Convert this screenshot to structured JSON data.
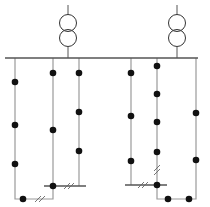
{
  "diagram": {
    "title": "",
    "colors": {
      "line": "#9a9a9a",
      "node": "#111111",
      "bus": "#555555"
    },
    "busbar": {
      "x1": 5,
      "x2": 198,
      "y": 58
    },
    "transformers": [
      {
        "id": "T1",
        "x": 68,
        "top": 5,
        "c1": 23,
        "c2": 38,
        "r": 8.5,
        "bottom": 58
      },
      {
        "id": "T2",
        "x": 177,
        "top": 5,
        "c1": 23,
        "c2": 38,
        "r": 8.5,
        "bottom": 58
      }
    ],
    "feeders": [
      {
        "id": "F1",
        "points": "15,58 15,199 53,199 53,58"
      },
      {
        "id": "F2",
        "points": "79,58 79,186"
      },
      {
        "id": "F3",
        "points": "131,58 131,185"
      },
      {
        "id": "F4",
        "points": "157,58 157,199 196,199 196,58"
      }
    ],
    "tie_lines": [
      {
        "x1": 44,
        "x2": 86,
        "y": 186
      },
      {
        "x1": 125,
        "x2": 167,
        "y": 185
      }
    ],
    "breaks": [
      {
        "x": 40,
        "y": 199,
        "orient": "h"
      },
      {
        "x": 69,
        "y": 186,
        "orient": "h"
      },
      {
        "x": 143,
        "y": 185,
        "orient": "h"
      },
      {
        "x": 157,
        "y": 170,
        "orient": "v"
      }
    ],
    "nodes": [
      {
        "x": 15,
        "y": 82
      },
      {
        "x": 15,
        "y": 125
      },
      {
        "x": 15,
        "y": 164
      },
      {
        "x": 23,
        "y": 199
      },
      {
        "x": 53,
        "y": 73
      },
      {
        "x": 53,
        "y": 130
      },
      {
        "x": 53,
        "y": 186
      },
      {
        "x": 79,
        "y": 73
      },
      {
        "x": 79,
        "y": 112
      },
      {
        "x": 79,
        "y": 151
      },
      {
        "x": 131,
        "y": 73
      },
      {
        "x": 131,
        "y": 116
      },
      {
        "x": 131,
        "y": 161
      },
      {
        "x": 157,
        "y": 66
      },
      {
        "x": 157,
        "y": 94
      },
      {
        "x": 157,
        "y": 122
      },
      {
        "x": 157,
        "y": 152
      },
      {
        "x": 157,
        "y": 185
      },
      {
        "x": 168,
        "y": 199
      },
      {
        "x": 189,
        "y": 199
      },
      {
        "x": 196,
        "y": 113
      },
      {
        "x": 196,
        "y": 160
      }
    ]
  }
}
